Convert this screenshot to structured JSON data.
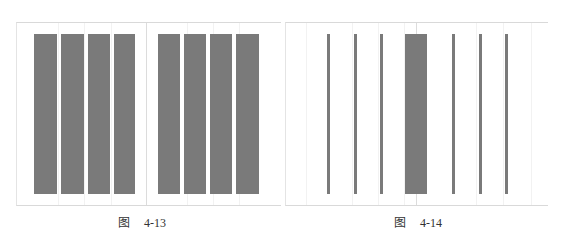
{
  "colors": {
    "bar": "#7a7a7a",
    "frame": "#d9d9d9",
    "background": "#ffffff"
  },
  "figures": [
    {
      "caption_prefix": "图",
      "caption_number": "4-13",
      "description": "Eight equal wide columns, four on each side of a center divider"
    },
    {
      "caption_prefix": "图",
      "caption_number": "4-14",
      "description": "Six thin column rules with one wide column at the center divider"
    }
  ]
}
